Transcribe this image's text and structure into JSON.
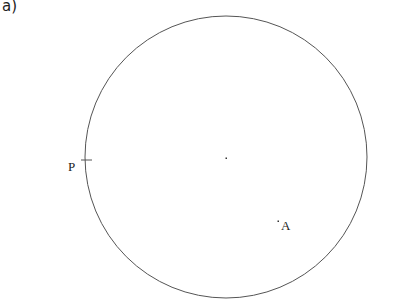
{
  "part_label": "a)",
  "diagram": {
    "circle": {
      "cx": 226,
      "cy": 157,
      "r": 141,
      "stroke": "#555555"
    },
    "center_dot": {
      "x": 226,
      "y": 158
    },
    "point_P": {
      "label": "P",
      "x": 86,
      "y": 160
    },
    "point_A": {
      "label": "A",
      "x": 278,
      "y": 221
    }
  }
}
